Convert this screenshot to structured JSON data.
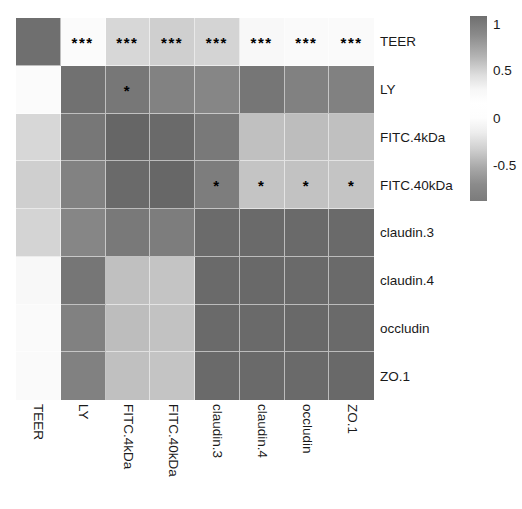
{
  "chart_data": {
    "type": "heatmap",
    "title": "",
    "xlabel": "",
    "ylabel": "",
    "colormap": "grey (dark = |r| high)",
    "categories": [
      "TEER",
      "LY",
      "FITC.4kDa",
      "FITC.40kDa",
      "claudin.3",
      "claudin.4",
      "occludin",
      "ZO.1"
    ],
    "x_tick_labels": [
      "TEER",
      "LY",
      "FITC.4kDa",
      "FITC.40kDa",
      "claudin.3",
      "claudin.4",
      "occludin",
      "ZO.1"
    ],
    "y_tick_labels": [
      "TEER",
      "LY",
      "FITC.4kDa",
      "FITC.40kDa",
      "claudin.3",
      "claudin.4",
      "occludin",
      "ZO.1"
    ],
    "x_tick_rotation_deg": 90,
    "grid": false,
    "legend_position": "right",
    "zlim": [
      -1,
      1
    ],
    "colorbar_ticks": [
      "1",
      "0.5",
      "0",
      "-0.5"
    ],
    "colorbar_tick_values": [
      1,
      0.5,
      0,
      -0.5
    ],
    "matrix": [
      [
        1.0,
        -0.82,
        -0.68,
        -0.74,
        -0.7,
        -0.83,
        -0.84,
        -0.83
      ],
      [
        -0.82,
        1.0,
        0.74,
        0.66,
        0.62,
        0.74,
        0.68,
        0.68
      ],
      [
        -0.68,
        0.74,
        1.0,
        0.9,
        0.7,
        0.48,
        0.5,
        0.48
      ],
      [
        -0.74,
        0.66,
        0.9,
        1.0,
        0.68,
        0.46,
        0.48,
        0.46
      ],
      [
        -0.7,
        0.62,
        0.7,
        0.68,
        1.0,
        0.92,
        0.92,
        0.92
      ],
      [
        -0.83,
        0.74,
        0.48,
        0.46,
        0.92,
        1.0,
        0.94,
        0.94
      ],
      [
        -0.84,
        0.68,
        0.5,
        0.48,
        0.92,
        0.94,
        1.0,
        0.94
      ],
      [
        -0.83,
        0.68,
        0.48,
        0.46,
        0.92,
        0.94,
        0.94,
        1.0
      ]
    ],
    "cell_colors": [
      [
        "#6f6f6f",
        "#fbfbfb",
        "#d7d7d7",
        "#cfcfcf",
        "#d4d4d4",
        "#f8f8f8",
        "#fafafa",
        "#fafafa"
      ],
      [
        "#fbfbfb",
        "#717171",
        "#777777",
        "#828282",
        "#868686",
        "#767676",
        "#818181",
        "#818181"
      ],
      [
        "#d7d7d7",
        "#777777",
        "#666666",
        "#6a6a6a",
        "#797979",
        "#c0c0c0",
        "#bdbdbd",
        "#c0c0c0"
      ],
      [
        "#cfcfcf",
        "#828282",
        "#6a6a6a",
        "#676767",
        "#7d7d7d",
        "#c4c4c4",
        "#c2c2c2",
        "#c4c4c4"
      ],
      [
        "#d4d4d4",
        "#868686",
        "#797979",
        "#7d7d7d",
        "#6b6b6b",
        "#6a6a6a",
        "#6a6a6a",
        "#6a6a6a"
      ],
      [
        "#f8f8f8",
        "#767676",
        "#c0c0c0",
        "#c4c4c4",
        "#6a6a6a",
        "#696969",
        "#6a6a6a",
        "#6a6a6a"
      ],
      [
        "#fafafa",
        "#818181",
        "#bdbdbd",
        "#c2c2c2",
        "#6a6a6a",
        "#6a6a6a",
        "#696969",
        "#6a6a6a"
      ],
      [
        "#fafafa",
        "#818181",
        "#c0c0c0",
        "#c4c4c4",
        "#6a6a6a",
        "#6a6a6a",
        "#6a6a6a",
        "#696969"
      ]
    ],
    "significance": [
      [
        "",
        "***",
        "***",
        "***",
        "***",
        "***",
        "***",
        "***"
      ],
      [
        "",
        "",
        "*",
        "",
        "",
        "",
        "",
        ""
      ],
      [
        "",
        "",
        "",
        "",
        "",
        "",
        "",
        ""
      ],
      [
        "",
        "",
        "",
        "",
        "*",
        "*",
        "*",
        "*"
      ],
      [
        "",
        "",
        "",
        "",
        "",
        "",
        "",
        ""
      ],
      [
        "",
        "",
        "",
        "",
        "",
        "",
        "",
        ""
      ],
      [
        "",
        "",
        "",
        "",
        "",
        "",
        "",
        ""
      ],
      [
        "",
        "",
        "",
        "",
        "",
        "",
        "",
        ""
      ]
    ]
  },
  "colorbar": {
    "ticks": [
      {
        "label": "1",
        "top_px": 2
      },
      {
        "label": "0.5",
        "top_px": 48
      },
      {
        "label": "0",
        "top_px": 96
      },
      {
        "label": "-0.5",
        "top_px": 143
      }
    ]
  },
  "colors": {
    "background": "#ffffff",
    "text": "#1a1a1a",
    "star": "#000000",
    "cell_border": "#ffffff"
  }
}
